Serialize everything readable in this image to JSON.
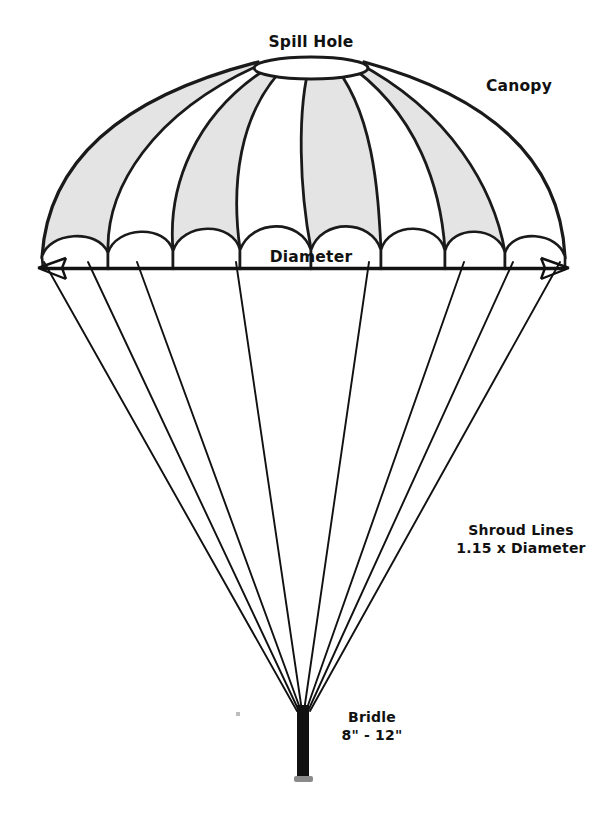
{
  "figure": {
    "background_color": "#ffffff",
    "ink_color": "#111111",
    "gore_shade_color": "#e4e4e4",
    "width": 610,
    "height": 816
  },
  "labels": {
    "spill_hole": "Spill Hole",
    "canopy": "Canopy",
    "diameter": "Diameter",
    "shroud_lines_title": "Shroud Lines",
    "shroud_lines_spec": "1.15 x Diameter",
    "bridle_title": "Bridle",
    "bridle_spec": "8\" - 12\""
  },
  "parts": [
    {
      "name": "spill-hole",
      "label": "Spill Hole",
      "description": "Elliptical vent opening at the apex of the canopy"
    },
    {
      "name": "canopy",
      "label": "Canopy",
      "description": "Domed fabric shell built from alternating shaded and plain gore panels"
    },
    {
      "name": "diameter",
      "label": "Diameter",
      "description": "Double-headed horizontal dimension arrow across the canopy skirt"
    },
    {
      "name": "shroud-lines",
      "label": "Shroud Lines",
      "description": "Suspension lines running from the skirt to the bridle confluence point",
      "spec": "1.15 x Diameter",
      "count": 8
    },
    {
      "name": "bridle",
      "label": "Bridle",
      "description": "Short heavy strap below the shroud line confluence point",
      "spec": "8\" - 12\""
    }
  ],
  "geometry": {
    "canopy_left_x": 42,
    "canopy_right_x": 565,
    "skirt_y": 268,
    "apex_y": 58,
    "spill_hole_cx": 311,
    "spill_hole_cy": 68,
    "spill_hole_rx": 57,
    "spill_hole_ry": 11,
    "confluence_x": 303,
    "confluence_y": 712,
    "bridle_bottom_y": 782,
    "gore_count": 8,
    "shroud_count": 8
  }
}
